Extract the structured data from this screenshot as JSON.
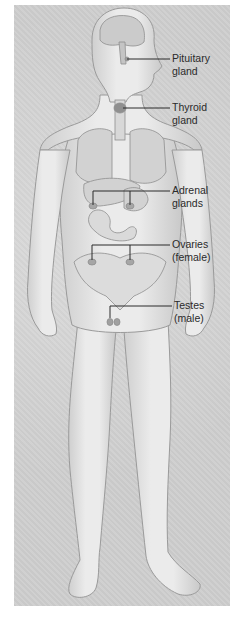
{
  "diagram": {
    "type": "anatomical illustration",
    "colors": {
      "background_panel": "#cfcfcf",
      "body_fill": "#e3e3e3",
      "body_outline": "#9a9a9a",
      "organ_fill": "#d2d2d2",
      "leader_line": "#2a2a2a",
      "label_text": "#2a2a2a"
    },
    "labels": [
      {
        "id": "pituitary",
        "line1": "Pituitary",
        "line2": "gland"
      },
      {
        "id": "thyroid",
        "line1": "Thyroid",
        "line2": "gland"
      },
      {
        "id": "adrenal",
        "line1": "Adrenal",
        "line2": "glands"
      },
      {
        "id": "ovaries",
        "line1": "Ovaries",
        "line2": "(female)"
      },
      {
        "id": "testes",
        "line1": "Testes",
        "line2": "(male)"
      }
    ]
  }
}
